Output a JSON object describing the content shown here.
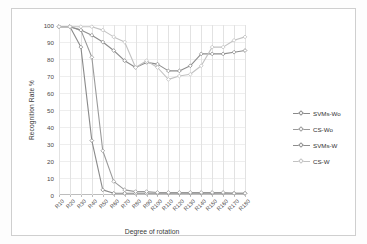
{
  "chart_data": {
    "type": "line",
    "title": "",
    "xlabel": "Degree of rotation",
    "ylabel": "Recognition Rate %",
    "ylim": [
      0,
      100
    ],
    "ytick_step": 10,
    "yticks": [
      0,
      10,
      20,
      30,
      40,
      50,
      60,
      70,
      80,
      90,
      100
    ],
    "grid": true,
    "legend_position": "right",
    "categories": [
      "R10",
      "R20",
      "R30",
      "R40",
      "R50",
      "R60",
      "R70",
      "R80",
      "R90",
      "R100",
      "R110",
      "R120",
      "R130",
      "R140",
      "R150",
      "R160",
      "R170",
      "R180"
    ],
    "series": [
      {
        "name": "SVMs-Wo",
        "color": "#8a8a8a",
        "values": [
          99,
          99,
          87,
          32,
          3,
          1,
          1,
          1,
          1,
          1,
          1,
          1,
          1,
          1,
          1,
          1,
          1,
          1
        ]
      },
      {
        "name": "CS-Wo",
        "color": "#9a9a9a",
        "values": [
          99,
          99,
          97,
          81,
          26,
          8,
          3,
          2,
          2,
          1.5,
          1.5,
          1.5,
          1.5,
          1.5,
          1.5,
          1.5,
          1,
          1
        ]
      },
      {
        "name": "SVMs-W",
        "color": "#8d8d8d",
        "values": [
          99,
          99,
          97,
          94,
          90,
          85,
          79,
          75,
          78,
          77,
          73,
          73,
          76,
          83,
          83,
          83,
          84,
          85
        ]
      },
      {
        "name": "CS-W",
        "color": "#c2c2c2",
        "values": [
          99,
          99,
          99,
          99,
          97,
          93,
          90,
          75,
          79,
          75,
          68,
          70,
          71,
          76,
          87,
          87,
          91,
          93
        ]
      }
    ]
  },
  "legend": {
    "items": [
      {
        "label": "SVMs-Wo"
      },
      {
        "label": "CS-Wo"
      },
      {
        "label": "SVMs-W"
      },
      {
        "label": "CS-W"
      }
    ]
  },
  "axes": {
    "y_title": "Recognition Rate %",
    "x_title": "Degree of rotation"
  }
}
